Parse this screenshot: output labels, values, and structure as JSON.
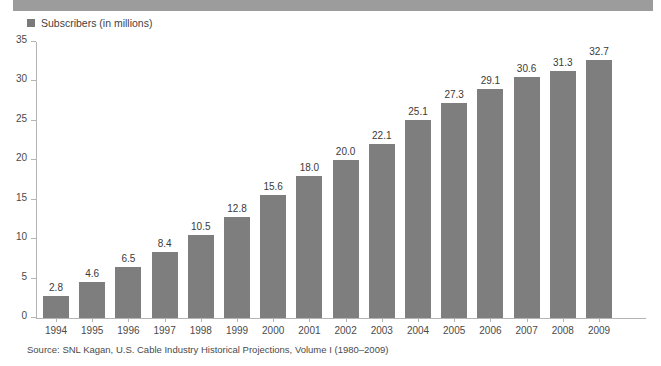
{
  "figure": {
    "title_band_present": true,
    "legend": {
      "marker_icon": "square-marker-icon",
      "label": "Subscribers (in millions)"
    },
    "source_note": "Source: SNL Kagan, U.S. Cable Industry Historical Projections, Volume I (1980–2009)"
  },
  "colors": {
    "bar": "#7e7e7e",
    "title_band": "#9c9c9c",
    "axis": "#b4b4b4",
    "text": "#3a3a3a",
    "background": "#ffffff"
  },
  "chart_data": {
    "type": "bar",
    "title": "",
    "subtitle": "",
    "xlabel": "",
    "ylabel": "",
    "legend": [
      "Subscribers (in millions)"
    ],
    "legend_position": "top-left",
    "grid": false,
    "ylim": [
      0,
      35
    ],
    "yticks": [
      0,
      5,
      10,
      15,
      20,
      25,
      30,
      35
    ],
    "ytick_labels": [
      "0",
      "5",
      "10",
      "15",
      "20",
      "25",
      "30",
      "35"
    ],
    "categories": [
      "1994",
      "1995",
      "1996",
      "1997",
      "1998",
      "1999",
      "2000",
      "2001",
      "2002",
      "2003",
      "2004",
      "2005",
      "2006",
      "2007",
      "2008",
      "2009"
    ],
    "values": [
      2.8,
      4.6,
      6.5,
      8.4,
      10.5,
      12.8,
      15.6,
      18.0,
      20.0,
      22.1,
      25.1,
      27.3,
      29.1,
      30.6,
      31.3,
      32.7
    ],
    "value_labels": [
      "2.8",
      "4.6",
      "6.5",
      "8.4",
      "10.5",
      "12.8",
      "15.6",
      "18.0",
      "20.0",
      "22.1",
      "25.1",
      "27.3",
      "29.1",
      "30.6",
      "31.3",
      "32.7"
    ],
    "series": [
      {
        "name": "Subscribers (in millions)",
        "values": [
          2.8,
          4.6,
          6.5,
          8.4,
          10.5,
          12.8,
          15.6,
          18.0,
          20.0,
          22.1,
          25.1,
          27.3,
          29.1,
          30.6,
          31.3,
          32.7
        ]
      }
    ]
  }
}
